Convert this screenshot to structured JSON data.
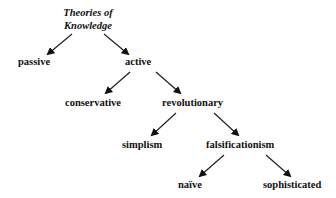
{
  "diagram": {
    "type": "tree",
    "root": {
      "line1": "Theories of",
      "line2": "Knowledge"
    },
    "nodes": {
      "passive": "passive",
      "active": "active",
      "conservative": "conservative",
      "revolutionary": "revolutionary",
      "simplism": "simplism",
      "falsificationism": "falsificationism",
      "naive": "naïve",
      "sophisticated": "sophisticated"
    },
    "edges": [
      {
        "from": "Theories of Knowledge",
        "to": "passive"
      },
      {
        "from": "Theories of Knowledge",
        "to": "active"
      },
      {
        "from": "active",
        "to": "conservative"
      },
      {
        "from": "active",
        "to": "revolutionary"
      },
      {
        "from": "revolutionary",
        "to": "simplism"
      },
      {
        "from": "revolutionary",
        "to": "falsificationism"
      },
      {
        "from": "falsificationism",
        "to": "naïve"
      },
      {
        "from": "falsificationism",
        "to": "sophisticated"
      }
    ]
  }
}
